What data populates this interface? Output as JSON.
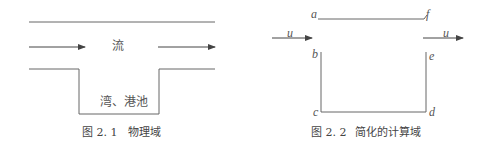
{
  "figure1": {
    "flow_label": "流",
    "basin_label": "湾、港池",
    "caption_num": "图 2. 1",
    "caption_text": "物理域"
  },
  "figure2": {
    "points": {
      "a": "a",
      "b": "b",
      "c": "c",
      "d": "d",
      "e": "e",
      "f": "f"
    },
    "velocity_in": "u",
    "velocity_out": "u",
    "caption_num": "图 2. 2",
    "caption_text": "简化的计算域"
  }
}
